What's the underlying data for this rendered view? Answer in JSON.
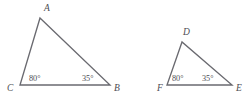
{
  "figure": {
    "stroke_color": "#6a6a70",
    "text_color": "#4d4d53",
    "background_color": "#ffffff",
    "triangles": [
      {
        "name": "triangle-abc",
        "vertices": [
          {
            "label": "A",
            "x": 40,
            "y": 18,
            "label_x": 44,
            "label_y": 11
          },
          {
            "label": "C",
            "x": 20,
            "y": 85,
            "label_x": 7,
            "label_y": 91
          },
          {
            "label": "B",
            "x": 110,
            "y": 85,
            "label_x": 114,
            "label_y": 91
          }
        ],
        "path": "M 40 18 L 20 85 L 110 85 Z",
        "angles": [
          {
            "at": "C",
            "value": "80°",
            "x": 29,
            "y": 81
          },
          {
            "at": "B",
            "value": "35°",
            "x": 82,
            "y": 81
          }
        ]
      },
      {
        "name": "triangle-def",
        "vertices": [
          {
            "label": "D",
            "x": 182,
            "y": 42,
            "label_x": 183,
            "label_y": 35
          },
          {
            "label": "F",
            "x": 167,
            "y": 85,
            "label_x": 157,
            "label_y": 91
          },
          {
            "label": "E",
            "x": 232,
            "y": 85,
            "label_x": 236,
            "label_y": 91
          }
        ],
        "path": "M 182 42 L 167 85 L 232 85 Z",
        "angles": [
          {
            "at": "F",
            "value": "80°",
            "x": 172,
            "y": 81
          },
          {
            "at": "E",
            "value": "35°",
            "x": 202,
            "y": 81
          }
        ]
      }
    ]
  },
  "chart_data": {
    "type": "diagram",
    "shapes": [
      {
        "id": "ABC",
        "kind": "triangle",
        "vertex_labels": [
          "A",
          "B",
          "C"
        ],
        "points": {
          "A": [
            40,
            18
          ],
          "B": [
            110,
            85
          ],
          "C": [
            20,
            85
          ]
        },
        "angle_measures": {
          "C": 80,
          "B": 35,
          "A": 65
        },
        "labeled_angles": [
          "C",
          "B"
        ]
      },
      {
        "id": "DEF",
        "kind": "triangle",
        "vertex_labels": [
          "D",
          "E",
          "F"
        ],
        "points": {
          "D": [
            182,
            42
          ],
          "E": [
            232,
            85
          ],
          "F": [
            167,
            85
          ]
        },
        "angle_measures": {
          "F": 80,
          "E": 35,
          "D": 65
        },
        "labeled_angles": [
          "F",
          "E"
        ]
      }
    ],
    "annotations": [
      "80°",
      "35°",
      "80°",
      "35°"
    ],
    "legend": [],
    "grid": false
  }
}
